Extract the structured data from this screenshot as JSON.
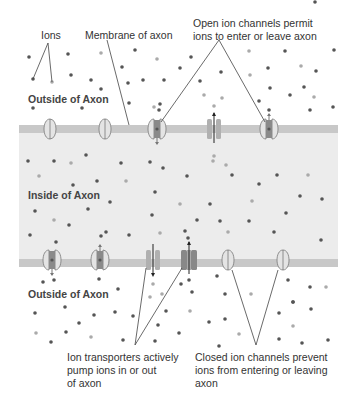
{
  "labels": {
    "ions": "Ions",
    "membrane": "Membrane of axon",
    "open_channels": [
      "Open ion channels permit",
      "ions to enter or leave axon"
    ],
    "transporters": [
      "Ion transporters actively",
      "pump ions in or out",
      "of axon"
    ],
    "closed_channels": [
      "Closed ion channels prevent",
      "ions from entering or leaving",
      "axon"
    ]
  },
  "regions": {
    "outside_top": "Outside of Axon",
    "inside": "Inside of Axon",
    "outside_bottom": "Outside of Axon"
  },
  "colors": {
    "membrane": "#c8c8c8",
    "inside": "#ececec",
    "ion_dark": "#555555",
    "ion_light": "#aaaaaa",
    "channel_fill": "#e4e4e4",
    "channel_pore": "#8a8a8a"
  },
  "top_membrane_proteins": [
    {
      "type": "closed-channel",
      "x": 50
    },
    {
      "type": "closed-channel",
      "x": 105
    },
    {
      "type": "open-channel",
      "x": 157,
      "arrow": "down"
    },
    {
      "type": "transporter",
      "x": 214,
      "arrow": "up",
      "shade": "light"
    },
    {
      "type": "open-channel",
      "x": 269,
      "arrow": "up"
    }
  ],
  "bottom_membrane_proteins": [
    {
      "type": "open-channel",
      "x": 52,
      "arrow": "down"
    },
    {
      "type": "open-channel",
      "x": 100,
      "arrow": "up"
    },
    {
      "type": "transporter",
      "x": 153,
      "arrow": "down",
      "shade": "light"
    },
    {
      "type": "transporter",
      "x": 189,
      "arrow": "up",
      "shade": "dark"
    },
    {
      "type": "closed-channel",
      "x": 228
    },
    {
      "type": "closed-channel",
      "x": 283
    }
  ]
}
